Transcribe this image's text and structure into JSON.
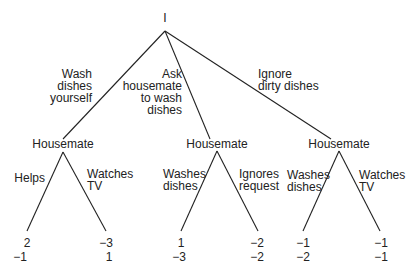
{
  "root": {
    "label": "I"
  },
  "first_moves": [
    {
      "label": "Wash\ndishes\nyourself"
    },
    {
      "label": "Ask\nhousemate\nto wash\ndishes"
    },
    {
      "label": "Ignore\ndirty dishes"
    }
  ],
  "subgames": [
    {
      "node": "Housemate",
      "left_action": "Helps",
      "right_action": "Watches\nTV",
      "left_payoff": {
        "me": "2",
        "housemate": "−1"
      },
      "right_payoff": {
        "me": "−3",
        "housemate": "1"
      }
    },
    {
      "node": "Housemate",
      "left_action": "Washes\ndishes",
      "right_action": "Ignores\nrequest",
      "left_payoff": {
        "me": "1",
        "housemate": "−3"
      },
      "right_payoff": {
        "me": "−2",
        "housemate": "−2"
      }
    },
    {
      "node": "Housemate",
      "left_action": "Washes\ndishes",
      "right_action": "Watches\nTV",
      "left_payoff": {
        "me": "−1",
        "housemate": "−2"
      },
      "right_payoff": {
        "me": "−1",
        "housemate": "−1"
      }
    }
  ]
}
